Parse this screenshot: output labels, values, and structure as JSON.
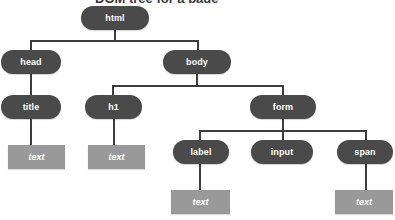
{
  "diagram": {
    "kind": "dom-tree",
    "title_fragment": "DOM tree for a page",
    "colors": {
      "element_node": "#4a4a4a",
      "text_node": "#999999",
      "edge": "#3d3d3d",
      "node_label": "#ffffff",
      "background": "#ffffff"
    },
    "nodes": [
      {
        "id": "html",
        "label": "html",
        "type": "element",
        "x": 81,
        "y": 6,
        "w": 68,
        "h": 24
      },
      {
        "id": "head",
        "label": "head",
        "type": "element",
        "x": 1,
        "y": 50,
        "w": 60,
        "h": 24
      },
      {
        "id": "body",
        "label": "body",
        "type": "element",
        "x": 163,
        "y": 50,
        "w": 68,
        "h": 24
      },
      {
        "id": "title",
        "label": "title",
        "type": "element",
        "x": 1,
        "y": 95,
        "w": 60,
        "h": 24
      },
      {
        "id": "h1",
        "label": "h1",
        "type": "element",
        "x": 85,
        "y": 95,
        "w": 57,
        "h": 24
      },
      {
        "id": "form",
        "label": "form",
        "type": "element",
        "x": 250,
        "y": 95,
        "w": 66,
        "h": 24
      },
      {
        "id": "label",
        "label": "label",
        "type": "element",
        "x": 173,
        "y": 140,
        "w": 56,
        "h": 24
      },
      {
        "id": "input",
        "label": "input",
        "type": "element",
        "x": 251,
        "y": 140,
        "w": 62,
        "h": 24
      },
      {
        "id": "span",
        "label": "span",
        "type": "element",
        "x": 337,
        "y": 140,
        "w": 56,
        "h": 24
      },
      {
        "id": "text-title",
        "label": "text",
        "type": "text",
        "x": 8,
        "y": 145,
        "w": 57,
        "h": 24
      },
      {
        "id": "text-h1",
        "label": "text",
        "type": "text",
        "x": 88,
        "y": 145,
        "w": 57,
        "h": 24
      },
      {
        "id": "text-label",
        "label": "text",
        "type": "text",
        "x": 171,
        "y": 190,
        "w": 59,
        "h": 24
      },
      {
        "id": "text-span",
        "label": "text",
        "type": "text",
        "x": 335,
        "y": 190,
        "w": 58,
        "h": 24
      }
    ],
    "edges": [
      {
        "from": "html",
        "to": "head",
        "kind": "elbow"
      },
      {
        "from": "html",
        "to": "body",
        "kind": "elbow"
      },
      {
        "from": "head",
        "to": "title",
        "kind": "straight"
      },
      {
        "from": "body",
        "to": "h1",
        "kind": "elbow"
      },
      {
        "from": "body",
        "to": "form",
        "kind": "elbow"
      },
      {
        "from": "title",
        "to": "text-title",
        "kind": "straight"
      },
      {
        "from": "h1",
        "to": "text-h1",
        "kind": "straight"
      },
      {
        "from": "form",
        "to": "label",
        "kind": "elbow"
      },
      {
        "from": "form",
        "to": "input",
        "kind": "straight"
      },
      {
        "from": "form",
        "to": "span",
        "kind": "elbow"
      },
      {
        "from": "label",
        "to": "text-label",
        "kind": "straight"
      },
      {
        "from": "span",
        "to": "text-span",
        "kind": "straight"
      }
    ]
  }
}
